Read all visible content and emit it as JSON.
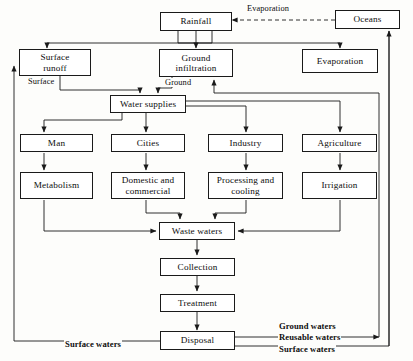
{
  "diagram": {
    "nodes": [
      {
        "id": "rainfall",
        "label": "Rainfall"
      },
      {
        "id": "oceans",
        "label": "Oceans"
      },
      {
        "id": "surface_runoff",
        "label": "Surface\nrunoff",
        "line1": "Surface",
        "line2": "runoff"
      },
      {
        "id": "ground_infiltration",
        "label": "Ground\ninfiltration",
        "line1": "Ground",
        "line2": "infiltration"
      },
      {
        "id": "evaporation_box",
        "label": "Evaporation"
      },
      {
        "id": "water_supplies",
        "label": "Water supplies"
      },
      {
        "id": "man",
        "label": "Man"
      },
      {
        "id": "cities",
        "label": "Cities"
      },
      {
        "id": "industry",
        "label": "Industry"
      },
      {
        "id": "agriculture",
        "label": "Agriculture"
      },
      {
        "id": "metabolism",
        "label": "Metabolism"
      },
      {
        "id": "domestic_commercial",
        "label": "Domestic and\ncommercial",
        "line1": "Domestic and",
        "line2": "commercial"
      },
      {
        "id": "processing_cooling",
        "label": "Processing and\ncooling",
        "line1": "Processing and",
        "line2": "cooling"
      },
      {
        "id": "irrigation",
        "label": "Irrigation"
      },
      {
        "id": "waste_waters",
        "label": "Waste waters"
      },
      {
        "id": "collection",
        "label": "Collection"
      },
      {
        "id": "treatment",
        "label": "Treatment"
      },
      {
        "id": "disposal",
        "label": "Disposal"
      }
    ],
    "edge_labels": [
      {
        "id": "evaporation_link",
        "text": "Evaporation"
      },
      {
        "id": "surface_link",
        "text": "Surface"
      },
      {
        "id": "ground_link",
        "text": "Ground"
      },
      {
        "id": "ground_waters_out",
        "text": "Ground waters"
      },
      {
        "id": "reusable_waters_out",
        "text": "Reusable waters"
      },
      {
        "id": "surface_waters_out_right",
        "text": "Surface waters"
      },
      {
        "id": "surface_waters_out_left",
        "text": "Surface waters"
      }
    ],
    "colors": {
      "stroke": "#1a1a1a",
      "box_fill": "#ffffff",
      "page_background": "#fdfdfb",
      "text": "#0d0d0d"
    }
  }
}
